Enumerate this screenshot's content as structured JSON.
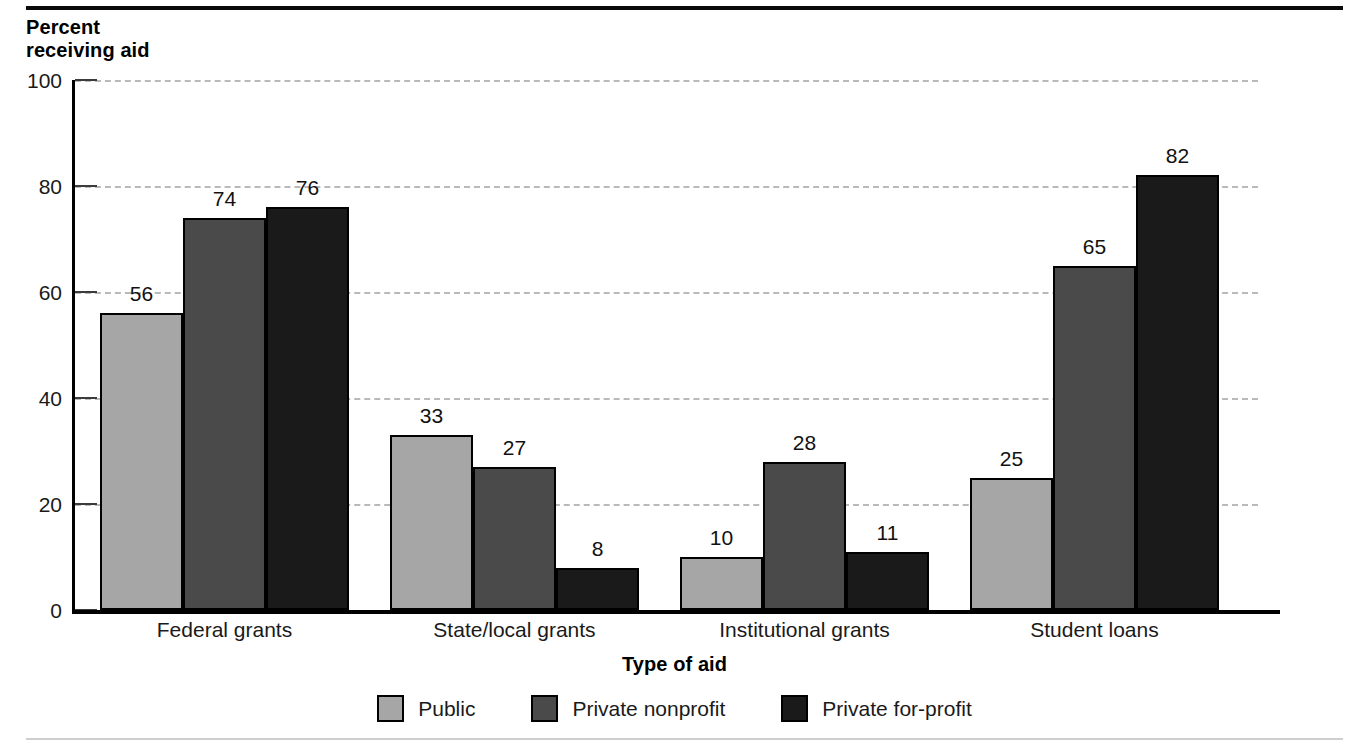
{
  "figure": {
    "y_axis_title": "Percent\nreceiving aid",
    "x_axis_title": "Type of aid"
  },
  "chart_data": {
    "type": "bar",
    "title": "",
    "subtitle": "",
    "xlabel": "Type of aid",
    "ylabel": "Percent receiving aid",
    "ylim": [
      0,
      100
    ],
    "yticks": [
      0,
      20,
      40,
      60,
      80,
      100
    ],
    "ytick_labels": [
      "0",
      "20",
      "40",
      "60",
      "80",
      "100"
    ],
    "grid": true,
    "grid_axis": "y",
    "grid_style": "dashed",
    "legend_position": "bottom-center",
    "categories": [
      "Federal grants",
      "State/local grants",
      "Institutional grants",
      "Student loans"
    ],
    "series": [
      {
        "name": "Public",
        "color": "#a6a6a6",
        "values": [
          56,
          33,
          10,
          25
        ],
        "labels": [
          "56",
          "33",
          "10",
          "25"
        ]
      },
      {
        "name": "Private nonprofit",
        "color": "#4a4a4a",
        "values": [
          74,
          27,
          28,
          65
        ],
        "labels": [
          "74",
          "27",
          "28",
          "65"
        ]
      },
      {
        "name": "Private for-profit",
        "color": "#1a1a1a",
        "values": [
          76,
          8,
          11,
          82
        ],
        "labels": [
          "76",
          "8",
          "11",
          "82"
        ]
      }
    ]
  },
  "legend": {
    "items": [
      {
        "label": "Public",
        "swatch": "public"
      },
      {
        "label": "Private nonprofit",
        "swatch": "nonprofit"
      },
      {
        "label": "Private for-profit",
        "swatch": "forprofit"
      }
    ]
  }
}
